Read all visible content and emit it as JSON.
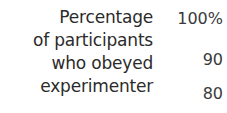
{
  "chart_data": {
    "type": "bar",
    "title": "",
    "ylabel": "Percentage of participants who obeyed experimenter",
    "xlabel": "",
    "ylabel_lines": [
      "Percentage",
      "of participants",
      "who obeyed",
      "experimenter"
    ],
    "y_tick_labels": [
      "100%",
      "90",
      "80"
    ],
    "y_tick_values": [
      100,
      90,
      80
    ],
    "ylim": [
      80,
      100
    ],
    "grid": false,
    "legend": "none",
    "categories": [],
    "values": [],
    "text_color": "#2b2b2b",
    "tick_color": "#3a3a3a",
    "background": "#ffffff"
  },
  "axis": {
    "title_lines": [
      "Percentage",
      "of participants",
      "who obeyed",
      "experimenter"
    ],
    "ticks": [
      {
        "label": "100%"
      },
      {
        "label": "90"
      },
      {
        "label": "80"
      }
    ]
  }
}
